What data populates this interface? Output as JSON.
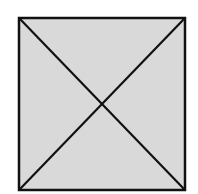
{
  "diagram": {
    "shape": "square",
    "fill_color": "#d9d9d9",
    "stroke_color": "#111111",
    "square": {
      "x": 18,
      "y": 17,
      "width": 168,
      "height": 174
    },
    "diagonals": [
      {
        "from": "top-left",
        "to": "bottom-right"
      },
      {
        "from": "top-right",
        "to": "bottom-left"
      }
    ]
  }
}
